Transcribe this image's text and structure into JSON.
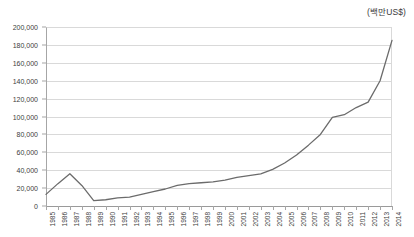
{
  "caption": {
    "unit_label": "(백만US$)"
  },
  "chart_data": {
    "type": "line",
    "title": "",
    "subtitle": "",
    "xlabel": "",
    "ylabel": "",
    "unit_note": "(백만US$)",
    "grid": true,
    "legend": false,
    "legend_position": "none",
    "line_color": "#6b6b6b",
    "gridline_color": "#d9d9d9",
    "axis_color": "#a6a6a6",
    "ylim": [
      0,
      200000
    ],
    "ytick_step": 20000,
    "ytick_labels": [
      "200,000",
      "180,000",
      "160,000",
      "140,000",
      "120,000",
      "100,000",
      "80,000",
      "60,000",
      "40,000",
      "20,000",
      "0"
    ],
    "ytick_values": [
      200000,
      180000,
      160000,
      140000,
      120000,
      100000,
      80000,
      60000,
      40000,
      20000,
      0
    ],
    "categories": [
      "1985",
      "1986",
      "1987",
      "1988",
      "1989",
      "1990",
      "1991",
      "1992",
      "1993",
      "1994",
      "1995",
      "1996",
      "1997",
      "1998",
      "1999",
      "2000",
      "2001",
      "2002",
      "2003",
      "2004",
      "2005",
      "2006",
      "2007",
      "2008",
      "2009",
      "2010",
      "2011",
      "2012",
      "2013",
      "2014"
    ],
    "series": [
      {
        "name": "",
        "values": [
          13000,
          25000,
          36000,
          23000,
          6000,
          7000,
          9000,
          10000,
          13000,
          16000,
          19000,
          23000,
          25000,
          26000,
          27000,
          29000,
          32000,
          34000,
          36000,
          41000,
          48000,
          57000,
          68000,
          80000,
          99000,
          102000,
          110000,
          116000,
          140000,
          185000
        ]
      }
    ]
  }
}
